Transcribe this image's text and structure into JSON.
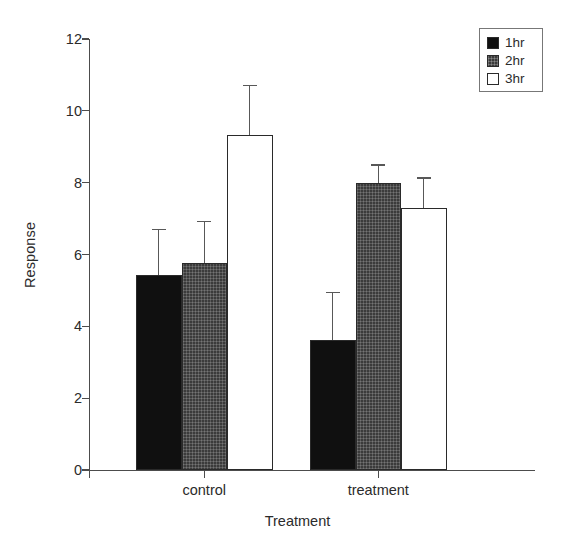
{
  "chart_data": {
    "type": "bar",
    "title": "",
    "xlabel": "Treatment",
    "ylabel": "Response",
    "categories": [
      "control",
      "treatment"
    ],
    "ylim": [
      0,
      12
    ],
    "yticks": [
      0,
      2,
      4,
      6,
      8,
      10,
      12
    ],
    "ytick_labels": [
      "0",
      "2",
      "4",
      "6",
      "8",
      "10",
      "12"
    ],
    "grid": false,
    "legend_position": "top-right",
    "error_bar_type": "upper-only",
    "series": [
      {
        "name": "1hr",
        "color": "#101010",
        "fill": "solid-black",
        "values": [
          5.43,
          3.62
        ],
        "errors": [
          1.28,
          1.34
        ]
      },
      {
        "name": "2hr",
        "color": "#3b3b3b",
        "fill": "hatched-gray",
        "values": [
          5.77,
          7.99
        ],
        "errors": [
          1.17,
          0.52
        ]
      },
      {
        "name": "3hr",
        "color": "#ffffff",
        "fill": "open-white",
        "values": [
          9.33,
          7.29
        ],
        "errors": [
          1.39,
          0.86
        ]
      }
    ]
  },
  "legend": {
    "entries": [
      {
        "label": "1hr",
        "fill": "fill-black"
      },
      {
        "label": "2hr",
        "fill": "fill-gray"
      },
      {
        "label": "3hr",
        "fill": "fill-white"
      }
    ]
  },
  "axes": {
    "y_title": "Response",
    "x_title": "Treatment"
  }
}
